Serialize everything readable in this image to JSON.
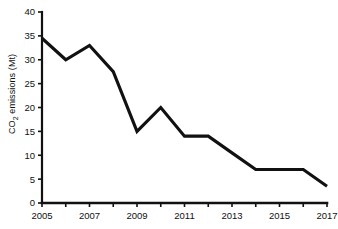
{
  "chart_data": {
    "type": "line",
    "title": "",
    "xlabel": "",
    "ylabel": "CO2 emissions (Mt)",
    "ylabel_parts": {
      "prefix": "CO",
      "sub": "2",
      "suffix": " emissions (Mt)"
    },
    "x": [
      2005,
      2006,
      2007,
      2008,
      2009,
      2010,
      2011,
      2012,
      2013,
      2014,
      2015,
      2016,
      2017
    ],
    "values": [
      34.5,
      30,
      33,
      27.5,
      15,
      20,
      14,
      14,
      10.5,
      7,
      7,
      7,
      3.5
    ],
    "xlim": [
      2005,
      2017
    ],
    "ylim": [
      0,
      40
    ],
    "ytick_labels": [
      "0",
      "5",
      "10",
      "15",
      "20",
      "25",
      "30",
      "35",
      "40"
    ],
    "ytick_values": [
      0,
      5,
      10,
      15,
      20,
      25,
      30,
      35,
      40
    ],
    "xtick_values": [
      2005,
      2006,
      2007,
      2008,
      2009,
      2010,
      2011,
      2012,
      2013,
      2014,
      2015,
      2016,
      2017
    ],
    "xtick_labels_shown": [
      "2005",
      "2007",
      "2009",
      "2011",
      "2013",
      "2015",
      "2017"
    ],
    "xtick_labeled_values": [
      2005,
      2007,
      2009,
      2011,
      2013,
      2015,
      2017
    ],
    "grid": false,
    "legend": null,
    "line_color": "#111111",
    "axis_color": "#111111",
    "background_color": "#ffffff"
  }
}
